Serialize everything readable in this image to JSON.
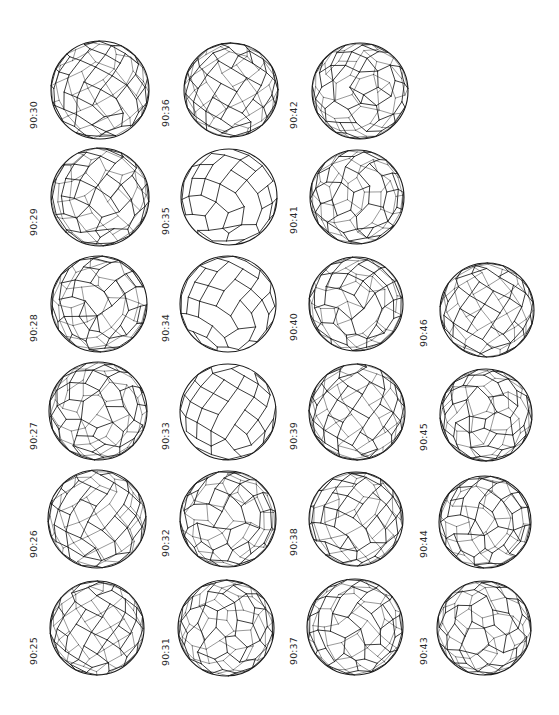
{
  "figure": {
    "stroke_color": "#1a1a1a",
    "label_color": "#2a2a2a",
    "cells": [
      {
        "label": "90:30",
        "col": 0,
        "row": 0,
        "cx": 100,
        "cy": 90,
        "r": 49,
        "seed": 30,
        "tilt": 20
      },
      {
        "label": "90:29",
        "col": 0,
        "row": 1,
        "cx": 100,
        "cy": 197,
        "r": 49,
        "seed": 29,
        "tilt": 35
      },
      {
        "label": "90:28",
        "col": 0,
        "row": 2,
        "cx": 99,
        "cy": 304,
        "r": 48,
        "seed": 28,
        "tilt": 55
      },
      {
        "label": "90:27",
        "col": 0,
        "row": 3,
        "cx": 98,
        "cy": 411,
        "r": 49,
        "seed": 27,
        "tilt": 70
      },
      {
        "label": "90:26",
        "col": 0,
        "row": 4,
        "cx": 97,
        "cy": 519,
        "r": 49,
        "seed": 26,
        "tilt": 15
      },
      {
        "label": "90:25",
        "col": 0,
        "row": 5,
        "cx": 97,
        "cy": 628,
        "r": 47,
        "seed": 25,
        "tilt": 0
      },
      {
        "label": "90:36",
        "col": 1,
        "row": 0,
        "cx": 231,
        "cy": 90,
        "r": 47,
        "seed": 36,
        "tilt": 0
      },
      {
        "label": "90:35",
        "col": 1,
        "row": 1,
        "cx": 229,
        "cy": 197,
        "r": 48,
        "seed": 35,
        "tilt": 40,
        "plain": true
      },
      {
        "label": "90:34",
        "col": 1,
        "row": 2,
        "cx": 228,
        "cy": 304,
        "r": 48,
        "seed": 34,
        "tilt": 25,
        "plain": true
      },
      {
        "label": "90:33",
        "col": 1,
        "row": 3,
        "cx": 228,
        "cy": 412,
        "r": 48,
        "seed": 33,
        "tilt": 10,
        "plain": true
      },
      {
        "label": "90:32",
        "col": 1,
        "row": 4,
        "cx": 228,
        "cy": 519,
        "r": 48,
        "seed": 32,
        "tilt": 60
      },
      {
        "label": "90:31",
        "col": 1,
        "row": 5,
        "cx": 226,
        "cy": 628,
        "r": 48,
        "seed": 31,
        "tilt": 80
      },
      {
        "label": "90:42",
        "col": 2,
        "row": 0,
        "cx": 360,
        "cy": 91,
        "r": 48,
        "seed": 42,
        "tilt": 75
      },
      {
        "label": "90:41",
        "col": 2,
        "row": 1,
        "cx": 357,
        "cy": 197,
        "r": 47,
        "seed": 41,
        "tilt": 65
      },
      {
        "label": "90:40",
        "col": 2,
        "row": 2,
        "cx": 356,
        "cy": 304,
        "r": 47,
        "seed": 40,
        "tilt": 50
      },
      {
        "label": "90:39",
        "col": 2,
        "row": 3,
        "cx": 357,
        "cy": 412,
        "r": 48,
        "seed": 39,
        "tilt": 0
      },
      {
        "label": "90:38",
        "col": 2,
        "row": 4,
        "cx": 356,
        "cy": 519,
        "r": 47,
        "seed": 38,
        "tilt": 30
      },
      {
        "label": "90:37",
        "col": 2,
        "row": 5,
        "cx": 355,
        "cy": 627,
        "r": 48,
        "seed": 37,
        "tilt": 45
      },
      {
        "label": "90:46",
        "col": 3,
        "row": 2,
        "cx": 487,
        "cy": 310,
        "r": 47,
        "seed": 46,
        "tilt": 0
      },
      {
        "label": "90:45",
        "col": 3,
        "row": 3,
        "cx": 486,
        "cy": 415,
        "r": 46,
        "seed": 45,
        "tilt": 85
      },
      {
        "label": "90:44",
        "col": 3,
        "row": 4,
        "cx": 485,
        "cy": 522,
        "r": 46,
        "seed": 44,
        "tilt": 55
      },
      {
        "label": "90:43",
        "col": 3,
        "row": 5,
        "cx": 484,
        "cy": 628,
        "r": 47,
        "seed": 43,
        "tilt": 90
      }
    ],
    "label_x_by_col": [
      28,
      160,
      288,
      418
    ],
    "label_bottom_offset": 50
  }
}
